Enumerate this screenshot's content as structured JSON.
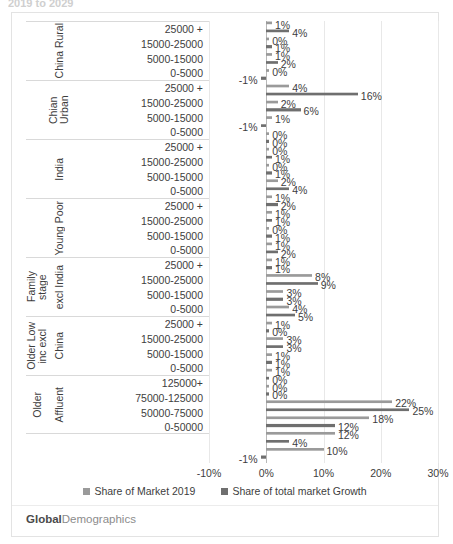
{
  "top_sliver_text": "2019 to 2029",
  "brand": {
    "part1": "Global",
    "part2": "Demographics"
  },
  "legend": [
    {
      "label": "Share of Market 2019",
      "color": "#9a9a9a"
    },
    {
      "label": "Share of total market Growth",
      "color": "#6f6f6f"
    }
  ],
  "xaxis": {
    "ticks": [
      "-10%",
      "0%",
      "10%",
      "20%",
      "30%"
    ],
    "tick_values": [
      -10,
      0,
      10,
      20,
      30
    ],
    "min": -10,
    "max": 30
  },
  "chart_data": {
    "type": "bar",
    "orientation": "horizontal",
    "title": "",
    "xlabel": "",
    "ylabel": "",
    "xlim": [
      -10,
      30
    ],
    "grid": true,
    "legend_position": "bottom",
    "series": [
      {
        "name": "Share of Market 2019",
        "color": "#9a9a9a"
      },
      {
        "name": "Share of total market Growth",
        "color": "#6f6f6f"
      }
    ],
    "groups": [
      {
        "outer_label": "",
        "inner_label": "China Rural",
        "bands": [
          {
            "label": "25000 +",
            "market_2019": 1,
            "growth_share": 4,
            "market_2019_label": "1%",
            "growth_share_label": "4%"
          },
          {
            "label": "15000-25000",
            "market_2019": 0,
            "growth_share": 1,
            "market_2019_label": "0%",
            "growth_share_label": "1%"
          },
          {
            "label": "5000-15000",
            "market_2019": 1,
            "growth_share": 2,
            "market_2019_label": "1%",
            "growth_share_label": "2%"
          },
          {
            "label": "0-5000",
            "market_2019": 0,
            "growth_share": -1,
            "market_2019_label": "0%",
            "growth_share_label": "-1%"
          }
        ]
      },
      {
        "outer_label": "",
        "inner_label": "Chian Urban",
        "bands": [
          {
            "label": "25000 +",
            "market_2019": 4,
            "growth_share": 16,
            "market_2019_label": "4%",
            "growth_share_label": "16%"
          },
          {
            "label": "15000-25000",
            "market_2019": 2,
            "growth_share": 6,
            "market_2019_label": "2%",
            "growth_share_label": "6%"
          },
          {
            "label": "5000-15000",
            "market_2019": 1,
            "growth_share": -1,
            "market_2019_label": "1%",
            "growth_share_label": "-1%"
          },
          {
            "label": "0-5000",
            "market_2019": 0,
            "growth_share": 0,
            "market_2019_label": "0%",
            "growth_share_label": "0%"
          }
        ]
      },
      {
        "outer_label": "",
        "inner_label": "India",
        "bands": [
          {
            "label": "25000 +",
            "market_2019": 0,
            "growth_share": 1,
            "market_2019_label": "0%",
            "growth_share_label": "1%"
          },
          {
            "label": "15000-25000",
            "market_2019": 0,
            "growth_share": 1,
            "market_2019_label": "0%",
            "growth_share_label": "1%"
          },
          {
            "label": "5000-15000",
            "market_2019": 2,
            "growth_share": 4,
            "market_2019_label": "2%",
            "growth_share_label": "4%"
          },
          {
            "label": "0-5000",
            "market_2019": 1,
            "growth_share": 2,
            "market_2019_label": "1%",
            "growth_share_label": "2%"
          }
        ]
      },
      {
        "outer_label": "",
        "inner_label": "Young Poor",
        "bands": [
          {
            "label": "25000 +",
            "market_2019": 1,
            "growth_share": 1,
            "market_2019_label": "1%",
            "growth_share_label": "1%"
          },
          {
            "label": "15000-25000",
            "market_2019": 0,
            "growth_share": 1,
            "market_2019_label": "0%",
            "growth_share_label": "1%"
          },
          {
            "label": "5000-15000",
            "market_2019": 1,
            "growth_share": 2,
            "market_2019_label": "1%",
            "growth_share_label": "2%"
          },
          {
            "label": "0-5000",
            "market_2019": 1,
            "growth_share": 1,
            "market_2019_label": "1%",
            "growth_share_label": "1%"
          }
        ]
      },
      {
        "outer_label": "Family stage",
        "inner_label": "excl India",
        "bands": [
          {
            "label": "25000 +",
            "market_2019": 8,
            "growth_share": 9,
            "market_2019_label": "8%",
            "growth_share_label": "9%"
          },
          {
            "label": "15000-25000",
            "market_2019": 3,
            "growth_share": 3,
            "market_2019_label": "3%",
            "growth_share_label": "3%"
          },
          {
            "label": "5000-15000",
            "market_2019": 4,
            "growth_share": 5,
            "market_2019_label": "4%",
            "growth_share_label": "5%"
          },
          {
            "label": "0-5000",
            "market_2019": 1,
            "growth_share": 0,
            "market_2019_label": "1%",
            "growth_share_label": "0%"
          }
        ]
      },
      {
        "outer_label": "Older Low\ninc excl",
        "inner_label": "China",
        "bands": [
          {
            "label": "25000 +",
            "market_2019": 3,
            "growth_share": 3,
            "market_2019_label": "3%",
            "growth_share_label": "3%"
          },
          {
            "label": "15000-25000",
            "market_2019": 1,
            "growth_share": 1,
            "market_2019_label": "1%",
            "growth_share_label": "1%"
          },
          {
            "label": "5000-15000",
            "market_2019": 1,
            "growth_share": 0,
            "market_2019_label": "1%",
            "growth_share_label": "0%"
          },
          {
            "label": "0-5000",
            "market_2019": 0,
            "growth_share": 0,
            "market_2019_label": "0%",
            "growth_share_label": "0%"
          }
        ]
      },
      {
        "outer_label": "Older",
        "inner_label": "Affluent",
        "bands": [
          {
            "label": "125000+",
            "market_2019": 22,
            "growth_share": 25,
            "market_2019_label": "22%",
            "growth_share_label": "25%"
          },
          {
            "label": "75000-125000",
            "market_2019": 18,
            "growth_share": 12,
            "market_2019_label": "18%",
            "growth_share_label": "12%"
          },
          {
            "label": "50000-75000",
            "market_2019": 12,
            "growth_share": 4,
            "market_2019_label": "12%",
            "growth_share_label": "4%"
          },
          {
            "label": "0-50000",
            "market_2019": 10,
            "growth_share": -1,
            "market_2019_label": "10%",
            "growth_share_label": "-1%"
          }
        ]
      }
    ]
  }
}
